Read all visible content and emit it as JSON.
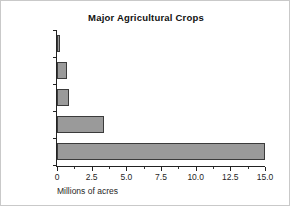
{
  "chart_data": {
    "type": "bar",
    "orientation": "horizontal",
    "title": "Major Agricultural Crops",
    "xlabel": "Millions of acres",
    "ylabel": "",
    "categories": [
      "sugar beet",
      "cotton",
      "rice",
      "barley",
      "wheat"
    ],
    "category_lines": [
      [
        "sugar",
        "beet"
      ],
      [
        "cotton"
      ],
      [
        "rice"
      ],
      [
        "barley"
      ],
      [
        "wheat"
      ]
    ],
    "values": [
      0.15,
      0.75,
      0.9,
      3.4,
      15.0
    ],
    "xlim": [
      0,
      15.0
    ],
    "xticks": [
      0,
      2.5,
      5.0,
      7.5,
      10.0,
      12.5,
      15.0
    ],
    "xticklabels": [
      "0",
      "2.5",
      "5.0",
      "7.5",
      "10.0",
      "12.5",
      "15.0"
    ],
    "grid": false,
    "legend": false,
    "bar_color": "#9a9a9a",
    "bar_edge_color": "#3b3b3b",
    "axis_color": "#222222",
    "background": "#ffffff"
  }
}
